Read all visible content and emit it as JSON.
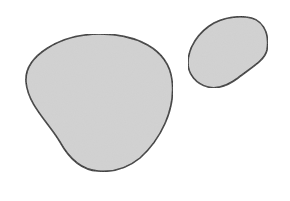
{
  "canvas": {
    "width": 290,
    "height": 201,
    "background": "#ffffff"
  },
  "style": {
    "fill": "#d3d3d3",
    "stroke": "#2e2e2e",
    "stroke_width": 1.6
  },
  "shapes": [
    {
      "name": "large-blob",
      "path": "M 100 34 C 135 34, 168 48, 172 80 C 176 110, 160 140, 140 158 C 124 171, 108 172, 98 171 C 82 170, 70 160, 60 142 C 48 122, 28 105, 26 82 C 24 56, 60 34, 100 34 Z"
    },
    {
      "name": "small-blob",
      "path": "M 246 17 C 262 18, 270 32, 267 50 C 265 60, 252 67, 238 78 C 226 87, 216 89, 208 87 C 196 84, 188 74, 188 63 C 188 48, 198 32, 214 23 C 224 18, 236 16, 246 17 Z"
    }
  ]
}
